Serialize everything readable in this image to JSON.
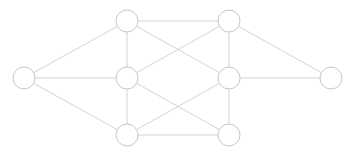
{
  "diagram": {
    "type": "node-link-graph",
    "title": "",
    "canvas": {
      "width": 356,
      "height": 157,
      "background": "#ffffff"
    },
    "style": {
      "node_fill": "#ffffff",
      "node_stroke": "#c0c0c0",
      "node_stroke_width": 0.9,
      "node_radius": 11,
      "edge_stroke": "#c8c8c8",
      "edge_stroke_width": 0.8
    },
    "nodes": [
      {
        "id": "n-left",
        "label": "",
        "x": 24,
        "y": 78,
        "r": 11
      },
      {
        "id": "n-top-left",
        "label": "",
        "x": 127,
        "y": 21,
        "r": 11
      },
      {
        "id": "n-top-right",
        "label": "",
        "x": 229,
        "y": 21,
        "r": 11
      },
      {
        "id": "n-mid-left",
        "label": "",
        "x": 127,
        "y": 78,
        "r": 11
      },
      {
        "id": "n-mid-right",
        "label": "",
        "x": 229,
        "y": 78,
        "r": 11
      },
      {
        "id": "n-bottom-left",
        "label": "",
        "x": 127,
        "y": 135,
        "r": 11
      },
      {
        "id": "n-bottom-right",
        "label": "",
        "x": 229,
        "y": 135,
        "r": 11
      },
      {
        "id": "n-right",
        "label": "",
        "x": 331,
        "y": 78,
        "r": 11
      }
    ],
    "edges": [
      {
        "from": "n-left",
        "to": "n-top-left"
      },
      {
        "from": "n-left",
        "to": "n-mid-left"
      },
      {
        "from": "n-left",
        "to": "n-bottom-left"
      },
      {
        "from": "n-top-left",
        "to": "n-top-right"
      },
      {
        "from": "n-top-left",
        "to": "n-mid-left"
      },
      {
        "from": "n-top-left",
        "to": "n-mid-right"
      },
      {
        "from": "n-top-right",
        "to": "n-mid-left"
      },
      {
        "from": "n-top-right",
        "to": "n-mid-right"
      },
      {
        "from": "n-mid-left",
        "to": "n-bottom-left"
      },
      {
        "from": "n-mid-left",
        "to": "n-bottom-right"
      },
      {
        "from": "n-mid-right",
        "to": "n-bottom-left"
      },
      {
        "from": "n-mid-right",
        "to": "n-bottom-right"
      },
      {
        "from": "n-bottom-left",
        "to": "n-bottom-right"
      },
      {
        "from": "n-top-right",
        "to": "n-right"
      },
      {
        "from": "n-mid-right",
        "to": "n-right"
      }
    ]
  }
}
